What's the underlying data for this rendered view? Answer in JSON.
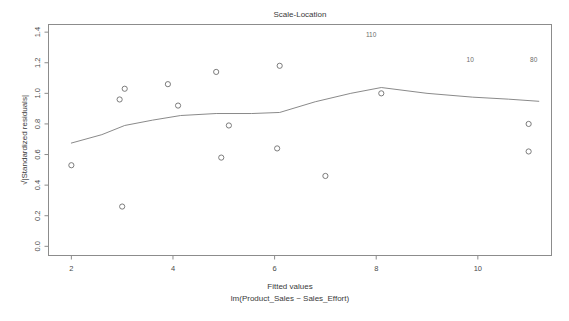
{
  "figure": {
    "title": "Scale-Location",
    "xlabel_line1": "Fitted values",
    "xlabel_line2": "lm(Product_Sales ~ Sales_Effort)",
    "ylabel": "√|Standardized residuals|",
    "background_color": "#ffffff",
    "frame_color": "#8c8c8c",
    "point_color": "#6e6e6e",
    "line_color": "#8a8a8a"
  },
  "axes": {
    "x_ticks": [
      "2",
      "4",
      "6",
      "8",
      "10"
    ],
    "x_tick_values": [
      2,
      4,
      6,
      8,
      10
    ],
    "y_ticks": [
      "0.0",
      "0.2",
      "0.4",
      "0.6",
      "0.8",
      "1.0",
      "1.2",
      "1.4"
    ],
    "y_tick_values": [
      0.0,
      0.2,
      0.4,
      0.6,
      0.8,
      1.0,
      1.2,
      1.4
    ],
    "xlim": [
      1.55,
      11.45
    ],
    "ylim": [
      -0.06,
      1.45
    ]
  },
  "chart_data": {
    "type": "scatter",
    "title": "Scale-Location",
    "xlabel": "Fitted values\nlm(Product_Sales ~ Sales_Effort)",
    "ylabel": "√|Standardized residuals|",
    "xlim": [
      1.55,
      11.45
    ],
    "ylim": [
      -0.06,
      1.45
    ],
    "grid": false,
    "legend": false,
    "series": [
      {
        "name": "observations",
        "marker": "open-circle",
        "points": [
          {
            "x": 2.0,
            "y": 0.53
          },
          {
            "x": 2.95,
            "y": 0.96
          },
          {
            "x": 3.05,
            "y": 1.03
          },
          {
            "x": 3.0,
            "y": 0.26
          },
          {
            "x": 3.9,
            "y": 1.06
          },
          {
            "x": 4.1,
            "y": 0.92
          },
          {
            "x": 4.85,
            "y": 1.14
          },
          {
            "x": 4.95,
            "y": 0.58
          },
          {
            "x": 5.1,
            "y": 0.79
          },
          {
            "x": 6.05,
            "y": 0.64
          },
          {
            "x": 6.1,
            "y": 1.18
          },
          {
            "x": 7.0,
            "y": 0.46
          },
          {
            "x": 8.1,
            "y": 1.0
          },
          {
            "x": 11.0,
            "y": 0.8
          },
          {
            "x": 11.0,
            "y": 0.62
          }
        ]
      },
      {
        "name": "loess-smoother",
        "marker": "line",
        "points": [
          {
            "x": 2.0,
            "y": 0.675
          },
          {
            "x": 2.6,
            "y": 0.73
          },
          {
            "x": 3.05,
            "y": 0.79
          },
          {
            "x": 3.6,
            "y": 0.825
          },
          {
            "x": 4.15,
            "y": 0.855
          },
          {
            "x": 4.85,
            "y": 0.868
          },
          {
            "x": 5.55,
            "y": 0.868
          },
          {
            "x": 6.1,
            "y": 0.875
          },
          {
            "x": 6.8,
            "y": 0.945
          },
          {
            "x": 7.5,
            "y": 1.0
          },
          {
            "x": 8.1,
            "y": 1.038
          },
          {
            "x": 9.0,
            "y": 1.0
          },
          {
            "x": 9.9,
            "y": 0.975
          },
          {
            "x": 10.6,
            "y": 0.962
          },
          {
            "x": 11.2,
            "y": 0.948
          }
        ]
      }
    ],
    "point_labels": [
      {
        "label": "110",
        "x": 7.9,
        "y": 1.37
      },
      {
        "label": "10",
        "x": 9.85,
        "y": 1.208
      },
      {
        "label": "80",
        "x": 11.1,
        "y": 1.208
      }
    ]
  }
}
